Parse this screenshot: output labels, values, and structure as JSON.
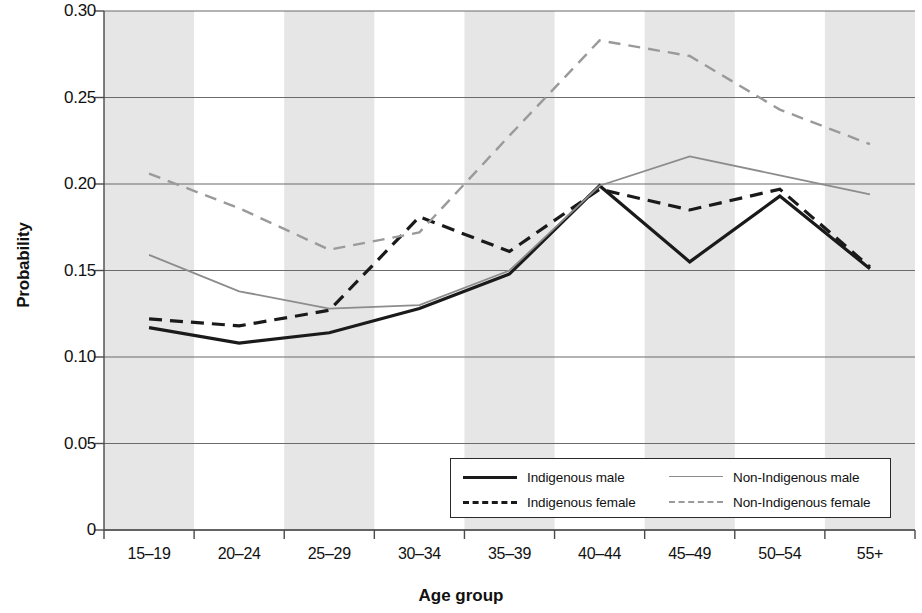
{
  "chart_data": {
    "type": "line",
    "title": "",
    "xlabel": "Age group",
    "ylabel": "Probability",
    "categories": [
      "15–19",
      "20–24",
      "25–29",
      "30–34",
      "35–39",
      "40–44",
      "45–49",
      "50–54",
      "55+"
    ],
    "ylim": [
      0,
      0.3
    ],
    "yticks": [
      0,
      0.05,
      0.1,
      0.15,
      0.2,
      0.25,
      0.3
    ],
    "ytick_labels": [
      "0",
      "0.05",
      "0.10",
      "0.15",
      "0.20",
      "0.25",
      "0.30"
    ],
    "grid": "horizontal",
    "banding": "alternating vertical grey bands, shaded on odd categories",
    "legend_position": "bottom-right inside plot",
    "series": [
      {
        "name": "Indigenous male",
        "style": "solid",
        "color": "#1a1a1a",
        "width": 3.2,
        "values": [
          0.117,
          0.108,
          0.114,
          0.128,
          0.148,
          0.199,
          0.155,
          0.193,
          0.151
        ]
      },
      {
        "name": "Indigenous female",
        "style": "dashed",
        "color": "#1a1a1a",
        "width": 3.2,
        "values": [
          0.122,
          0.118,
          0.127,
          0.181,
          0.161,
          0.197,
          0.185,
          0.197,
          0.152
        ]
      },
      {
        "name": "Non-Indigenous male",
        "style": "solid",
        "color": "#8c8c8c",
        "width": 1.8,
        "values": [
          0.159,
          0.138,
          0.128,
          0.13,
          0.15,
          0.199,
          0.216,
          0.205,
          0.194
        ]
      },
      {
        "name": "Non-Indigenous female",
        "style": "dashed",
        "color": "#9a9a9a",
        "width": 2.4,
        "values": [
          0.206,
          0.186,
          0.162,
          0.172,
          0.228,
          0.283,
          0.274,
          0.243,
          0.223
        ]
      }
    ]
  },
  "colors": {
    "band": "#e6e6e6",
    "grid": "#6b6b6b",
    "axis": "#4a4a4a",
    "text": "#111111"
  }
}
